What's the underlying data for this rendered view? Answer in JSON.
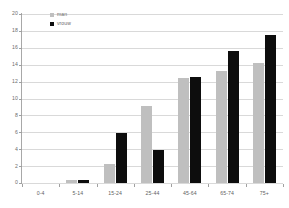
{
  "chart_data": {
    "type": "bar",
    "title": "",
    "subtitle": "",
    "xlabel": "",
    "ylabel": "",
    "categories": [
      "0-4",
      "5-14",
      "15-24",
      "25-44",
      "45-64",
      "65-74",
      "75+"
    ],
    "series": [
      {
        "name": "man",
        "color": "#bfbfbf",
        "values": [
          0,
          0.4,
          2.3,
          9.1,
          12.4,
          13.3,
          14.2
        ]
      },
      {
        "name": "vrouw",
        "color": "#0d0d0d",
        "values": [
          0,
          0.3,
          5.9,
          3.9,
          12.6,
          15.6,
          17.5
        ]
      }
    ],
    "ylim": [
      0,
      20
    ],
    "yticks": [
      0,
      2,
      4,
      6,
      8,
      10,
      12,
      14,
      16,
      18,
      20
    ],
    "ytick_labels": [
      "0",
      "2",
      "4",
      "6",
      "8",
      "10",
      "12",
      "14",
      "16",
      "18",
      "20"
    ],
    "grid": true,
    "legend_position": "top-left",
    "annotations": []
  },
  "legend": {
    "items": [
      {
        "label": "man"
      },
      {
        "label": "vrouw"
      }
    ]
  },
  "colors": {
    "series_man": "#bfbfbf",
    "series_vrouw": "#0d0d0d",
    "gridline": "#d9d9d9",
    "axis": "#a0a0a0",
    "tick_text": "#6a6a6a",
    "background": "#ffffff"
  }
}
